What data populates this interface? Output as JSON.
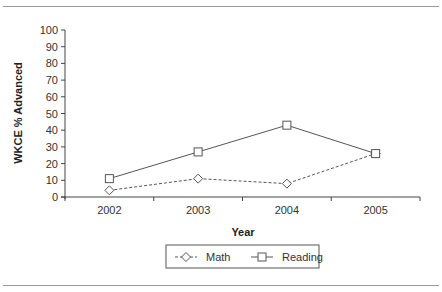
{
  "chart_data": {
    "type": "line",
    "title": "",
    "xlabel": "Year",
    "ylabel": "WKCE % Advanced",
    "categories": [
      "2002",
      "2003",
      "2004",
      "2005"
    ],
    "series": [
      {
        "name": "Math",
        "values": [
          4,
          11,
          8,
          26
        ],
        "line_style": "dashed",
        "marker": "diamond"
      },
      {
        "name": "Reading",
        "values": [
          11,
          27,
          43,
          26
        ],
        "line_style": "solid",
        "marker": "square"
      }
    ],
    "ylim": [
      0,
      100
    ],
    "yticks": [
      "0",
      "10",
      "20",
      "30",
      "40",
      "50",
      "60",
      "70",
      "80",
      "90",
      "100"
    ],
    "grid": false,
    "legend_position": "bottom"
  },
  "colors": {
    "line": "#555555",
    "axis": "#444444",
    "rule": "#9a9a9a"
  }
}
